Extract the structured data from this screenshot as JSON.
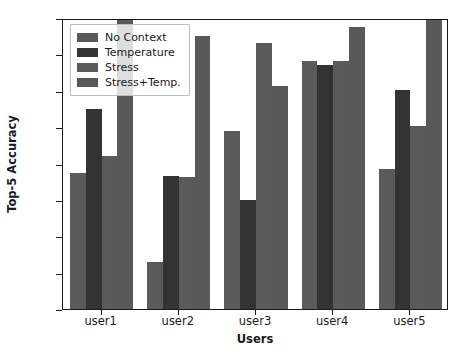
{
  "chart_data": {
    "type": "bar",
    "title": "",
    "xlabel": "Users",
    "ylabel": "Top-5 Accuracy",
    "categories": [
      "user1",
      "user2",
      "user3",
      "user4",
      "user5"
    ],
    "ylim": [
      0.6,
      1.0
    ],
    "yticks": [
      "0.60",
      "0.65",
      "0.70",
      "0.75",
      "0.80",
      "0.85",
      "0.90",
      "0.95",
      "1.00"
    ],
    "ytick_values": [
      0.6,
      0.65,
      0.7,
      0.75,
      0.8,
      0.85,
      0.9,
      0.95,
      1.0
    ],
    "grid": false,
    "legend_position": "upper left",
    "series": [
      {
        "name": "No Context",
        "color": "#5a5a5a",
        "values": [
          0.787,
          0.665,
          0.845,
          0.941,
          0.793
        ]
      },
      {
        "name": "Temperature",
        "color": "#333333",
        "values": [
          0.875,
          0.783,
          0.75,
          0.935,
          0.901
        ]
      },
      {
        "name": "Stress",
        "color": "#5a5a5a",
        "values": [
          0.811,
          0.781,
          0.966,
          0.941,
          0.852
        ]
      },
      {
        "name": "Stress+Temp.",
        "color": "#595959",
        "values": [
          0.999,
          0.975,
          0.907,
          0.987,
          1.0
        ]
      }
    ]
  }
}
